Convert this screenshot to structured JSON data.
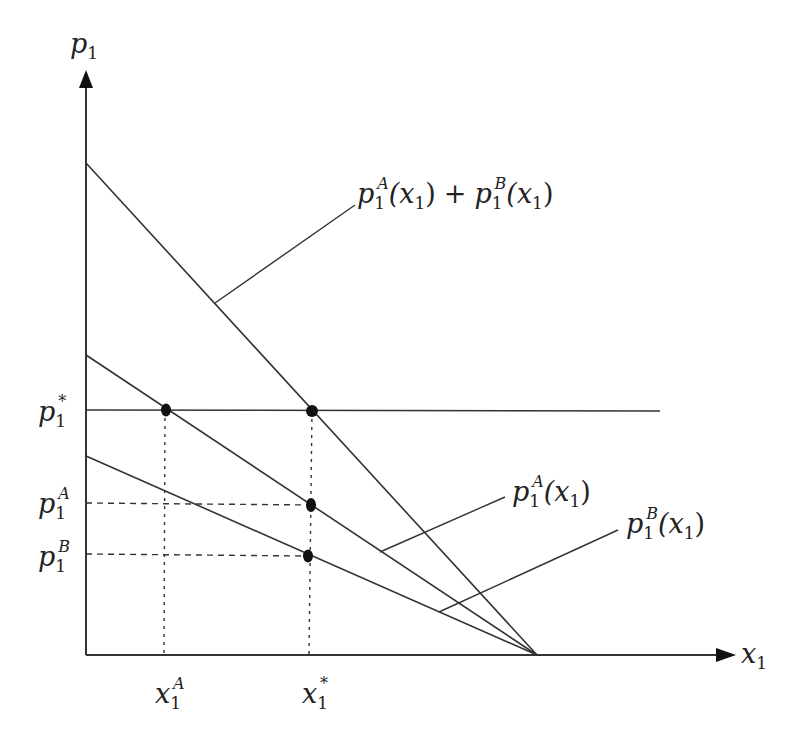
{
  "diagram": {
    "type": "economics-supply-diagram",
    "axes": {
      "y_label": {
        "base": "p",
        "sub": "1"
      },
      "x_label": {
        "base": "x",
        "sub": "1"
      }
    },
    "curves": {
      "combined": {
        "base1": "p",
        "sub1": "1",
        "sup1": "A",
        "arg1": "(x",
        "argsub1": "1",
        "close1": ")",
        "plus": "+",
        "base2": "p",
        "sub2": "1",
        "sup2": "B",
        "arg2": "(x",
        "argsub2": "1",
        "close2": ")"
      },
      "curve_a": {
        "base": "p",
        "sub": "1",
        "sup": "A",
        "arg": "(x",
        "argsub": "1",
        "close": ")"
      },
      "curve_b": {
        "base": "p",
        "sub": "1",
        "sup": "B",
        "arg": "(x",
        "argsub": "1",
        "close": ")"
      }
    },
    "y_ticks": [
      {
        "base": "p",
        "sub": "1",
        "sup": "*"
      },
      {
        "base": "p",
        "sub": "1",
        "sup": "A"
      },
      {
        "base": "p",
        "sub": "1",
        "sup": "B"
      }
    ],
    "x_ticks": [
      {
        "base": "x",
        "sub": "1",
        "sup": "A"
      },
      {
        "base": "x",
        "sub": "1",
        "sup": "*"
      }
    ],
    "colors": {
      "line": "#333333",
      "dot": "#111111",
      "background": "#ffffff"
    }
  }
}
